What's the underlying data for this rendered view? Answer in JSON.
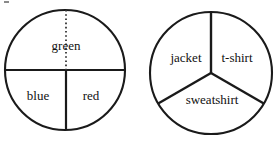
{
  "figure": {
    "background_color": "#ffffff",
    "line_color": "#1a1a1a",
    "text_color": "#111111",
    "width": 277,
    "height": 142
  },
  "spinners": [
    {
      "name": "color-spinner",
      "center_x": 65,
      "center_y": 70,
      "radius": 60,
      "description": "Circle split by a horizontal diameter; top half is one region, bottom half split into two quarters; a dotted radius marks the top half into two equal quarters.",
      "sectors": [
        {
          "label": "green",
          "label_x": 66,
          "label_y": 47,
          "fraction": "1/2",
          "degrees": 180
        },
        {
          "label": "blue",
          "label_x": 38,
          "label_y": 97,
          "fraction": "1/4",
          "degrees": 90
        },
        {
          "label": "red",
          "label_x": 91,
          "label_y": 97,
          "fraction": "1/4",
          "degrees": 90
        }
      ],
      "dividers": [
        {
          "style": "solid",
          "x1": 5,
          "y1": 70,
          "x2": 125,
          "y2": 70
        },
        {
          "style": "solid",
          "x1": 66,
          "y1": 70,
          "x2": 66,
          "y2": 130
        },
        {
          "style": "dotted",
          "x1": 66,
          "y1": 10,
          "x2": 66,
          "y2": 70
        }
      ]
    },
    {
      "name": "clothing-spinner",
      "center_x": 211,
      "center_y": 73,
      "radius": 61,
      "description": "Circle split into three equal sectors of 120 degrees each.",
      "sectors": [
        {
          "label": "jacket",
          "label_x": 186,
          "label_y": 59,
          "fraction": "1/3",
          "degrees": 120
        },
        {
          "label": "t-shirt",
          "label_x": 237,
          "label_y": 59,
          "fraction": "1/3",
          "degrees": 120
        },
        {
          "label": "sweatshirt",
          "label_x": 212,
          "label_y": 101,
          "fraction": "1/3",
          "degrees": 120
        }
      ],
      "dividers": [
        {
          "style": "solid",
          "x1": 211,
          "y1": 73,
          "x2": 211,
          "y2": 12
        },
        {
          "style": "solid",
          "x1": 211,
          "y1": 73,
          "x2": 158,
          "y2": 104
        },
        {
          "style": "solid",
          "x1": 211,
          "y1": 73,
          "x2": 264,
          "y2": 104
        }
      ]
    }
  ]
}
